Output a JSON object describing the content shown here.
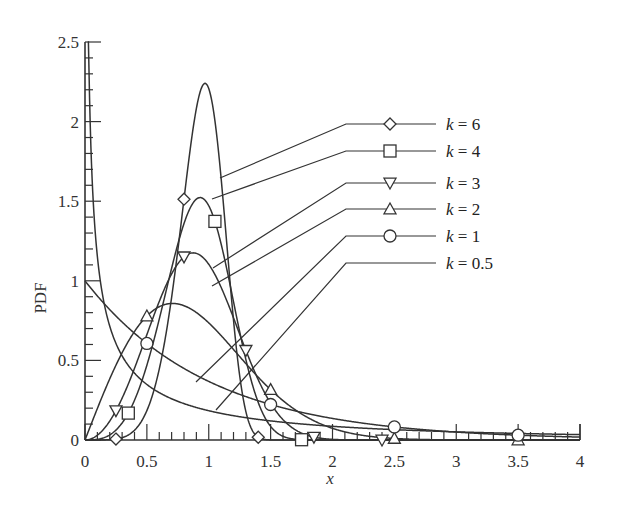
{
  "chart_data": {
    "type": "line",
    "title": "",
    "xlabel": "x",
    "ylabel": "PDF",
    "xlim": [
      0,
      4
    ],
    "ylim": [
      0,
      2.5
    ],
    "x_ticks": [
      "0",
      "0.5",
      "1",
      "1.5",
      "2",
      "2.5",
      "3",
      "3.5",
      "4"
    ],
    "y_ticks": [
      "0",
      "0.5",
      "1",
      "1.5",
      "2",
      "2.5"
    ],
    "grid": false,
    "legend_position": "upper right (leader lines to curves)",
    "function": "Weibull PDF f(x) = k x^(k-1) exp(-x^k), scale = 1",
    "series": [
      {
        "name": "k = 6",
        "k": 6,
        "marker": "diamond",
        "marker_x": [
          0.25,
          0.8,
          1.4
        ],
        "peak": {
          "x": 0.97,
          "y": 2.23
        }
      },
      {
        "name": "k = 4",
        "k": 4,
        "marker": "square",
        "marker_x": [
          0.35,
          1.05,
          1.75
        ],
        "peak": {
          "x": 0.93,
          "y": 1.52
        }
      },
      {
        "name": "k = 3",
        "k": 3,
        "marker": "triangle-down",
        "marker_x": [
          0.25,
          0.8,
          1.3,
          1.85,
          2.4
        ],
        "peak": {
          "x": 0.87,
          "y": 1.22
        }
      },
      {
        "name": "k = 2",
        "k": 2,
        "marker": "triangle-up",
        "marker_x": [
          0.5,
          1.5,
          2.5,
          3.5
        ],
        "peak": {
          "x": 0.71,
          "y": 0.86
        }
      },
      {
        "name": "k = 1",
        "k": 1,
        "marker": "circle",
        "marker_x": [
          0.5,
          1.5,
          2.5,
          3.5
        ],
        "peak": {
          "x": 0,
          "y": 1.0
        }
      },
      {
        "name": "k = 0.5",
        "k": 0.5,
        "marker": "none",
        "marker_x": [],
        "peak": {
          "x": 0.02,
          "y": 1.7
        }
      }
    ]
  },
  "labels": {
    "ylabel": "PDF",
    "xlabel": "x",
    "legend": [
      "k = 6",
      "k = 4",
      "k = 3",
      "k = 2",
      "k = 1",
      "k = 0.5"
    ]
  }
}
